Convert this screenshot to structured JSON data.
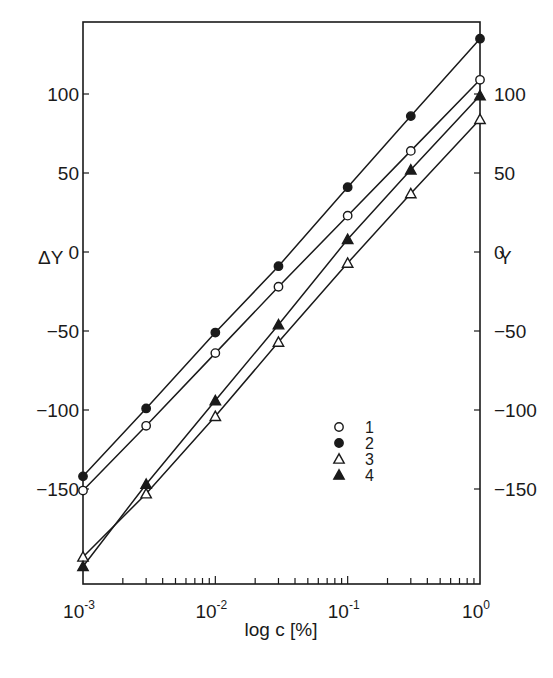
{
  "chart_data": {
    "type": "line",
    "title": "",
    "xlabel": "log c [%]",
    "ylabel_left": "ΔY",
    "ylabel_right": "Y",
    "xscale": "log",
    "xlim": [
      0.001,
      1
    ],
    "ylim": [
      -212,
      146
    ],
    "grid": false,
    "x_ticks": [
      {
        "value": 0.001,
        "base": "10",
        "exp": "-3"
      },
      {
        "value": 0.01,
        "base": "10",
        "exp": "-2"
      },
      {
        "value": 0.1,
        "base": "10",
        "exp": "-1"
      },
      {
        "value": 1,
        "base": "10",
        "exp": "0"
      }
    ],
    "x_minor_ticks": [
      0.002,
      0.003,
      0.004,
      0.005,
      0.006,
      0.007,
      0.008,
      0.009,
      0.02,
      0.03,
      0.04,
      0.05,
      0.06,
      0.07,
      0.08,
      0.09,
      0.2,
      0.3,
      0.4,
      0.5,
      0.6,
      0.7,
      0.8,
      0.9
    ],
    "y_ticks_left": [
      {
        "value": 100,
        "label": "100"
      },
      {
        "value": 50,
        "label": "50"
      },
      {
        "value": 0,
        "label": "0"
      },
      {
        "value": -50,
        "label": "-50"
      },
      {
        "value": -100,
        "label": "-100"
      },
      {
        "value": -150,
        "label": "-150"
      }
    ],
    "y_ticks_right": [
      {
        "value": 100,
        "label": "100"
      },
      {
        "value": 50,
        "label": "50"
      },
      {
        "value": 0,
        "label": "0"
      },
      {
        "value": -50,
        "label": "-50"
      },
      {
        "value": -100,
        "label": "-100"
      },
      {
        "value": -150,
        "label": "-150"
      }
    ],
    "x": [
      0.001,
      0.003,
      0.01,
      0.03,
      0.1,
      0.3,
      1
    ],
    "series": [
      {
        "name": "1",
        "marker": "open-circle",
        "values": [
          -151,
          -110,
          -64,
          -22,
          23,
          64,
          109
        ]
      },
      {
        "name": "2",
        "marker": "filled-circle",
        "values": [
          -142,
          -99,
          -51,
          -9,
          41,
          86,
          135
        ]
      },
      {
        "name": "3",
        "marker": "open-triangle",
        "values": [
          -193,
          -153,
          -104,
          -57,
          -7,
          37,
          84
        ]
      },
      {
        "name": "4",
        "marker": "filled-triangle",
        "values": [
          -199,
          -147,
          -94,
          -46,
          8,
          52,
          99
        ]
      }
    ],
    "legend": {
      "position": "lower-right",
      "entries": [
        {
          "label": "1",
          "marker": "open-circle"
        },
        {
          "label": "2",
          "marker": "filled-circle"
        },
        {
          "label": "3",
          "marker": "open-triangle"
        },
        {
          "label": "4",
          "marker": "filled-triangle"
        }
      ]
    },
    "colors": {
      "ink": "#1a1a1a",
      "background": "#ffffff"
    }
  }
}
